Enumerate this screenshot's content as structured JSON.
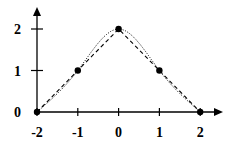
{
  "chart_data": {
    "type": "line",
    "title": "",
    "xlabel": "",
    "ylabel": "",
    "xlim": [
      -2,
      2
    ],
    "ylim": [
      0,
      2
    ],
    "x_ticks": [
      -2,
      -1,
      0,
      1,
      2
    ],
    "x_tick_labels": [
      "-2",
      "-1",
      "0",
      "1",
      "2"
    ],
    "y_ticks": [
      0,
      1,
      2
    ],
    "y_tick_labels": [
      "0",
      "1",
      "2"
    ],
    "grid": false,
    "legend": null,
    "points": {
      "x": [
        -2,
        -1,
        0,
        1,
        2
      ],
      "y": [
        0,
        1,
        2,
        1,
        0
      ]
    },
    "series": [
      {
        "name": "data points",
        "style": "markers",
        "x": [
          -2,
          -1,
          0,
          1,
          2
        ],
        "y": [
          0,
          1,
          2,
          1,
          0
        ]
      },
      {
        "name": "linear interpolation",
        "style": "dashed",
        "x": [
          -2,
          -1,
          0,
          1,
          2
        ],
        "y": [
          0,
          1,
          2,
          1,
          0
        ]
      },
      {
        "name": "smooth interpolation",
        "style": "dotted",
        "x": [
          -2,
          -1,
          0,
          1,
          2
        ],
        "y": [
          0,
          1,
          2,
          1,
          0
        ]
      }
    ]
  }
}
